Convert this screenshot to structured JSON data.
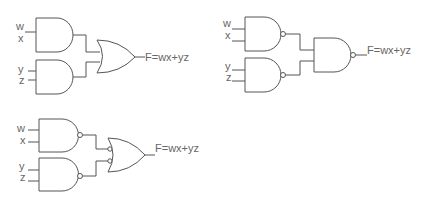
{
  "diagram": {
    "circuits": [
      {
        "id": "and-or",
        "inputs": [
          "w",
          "x",
          "y",
          "z"
        ],
        "first_level": "AND",
        "second_level": "OR",
        "output_label": "F=wx+yz"
      },
      {
        "id": "nand-nand",
        "inputs": [
          "w",
          "x",
          "y",
          "z"
        ],
        "first_level": "NAND",
        "second_level": "NAND",
        "output_label": "F=wx+yz"
      },
      {
        "id": "nand-invor",
        "inputs": [
          "w",
          "x",
          "y",
          "z"
        ],
        "first_level": "NAND",
        "second_level": "OR with inverted inputs",
        "output_label": "F=wx+yz"
      }
    ]
  }
}
